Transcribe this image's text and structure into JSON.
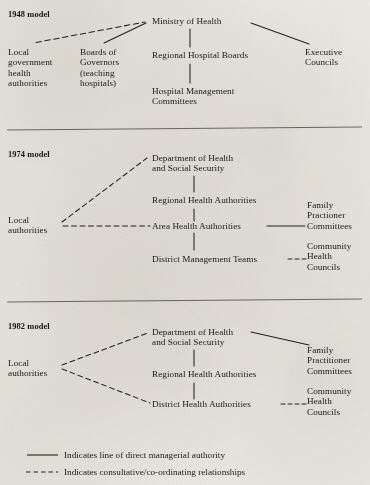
{
  "models": [
    {
      "id": "1948",
      "heading": "1948 model",
      "nodes": {
        "ministry": "Ministry of Health",
        "local_gov": "Local\ngovernment\nhealth\nauthorities",
        "boards_gov": "Boards of\nGovernors\n(teaching\nhospitals)",
        "regional_hospital_boards": "Regional Hospital Boards",
        "hospital_mgmt": "Hospital Management\nCommittees",
        "executive_councils": "Executive\nCouncils"
      }
    },
    {
      "id": "1974",
      "heading": "1974 model",
      "nodes": {
        "dhss": "Department of Health\nand Social Security",
        "local_authorities": "Local\nauthorities",
        "regional_health_authorities": "Regional Health Authorities",
        "area_health_authorities": "Area Health Authorities",
        "district_management_teams": "District Management Teams",
        "family_practioner_committees": "Family\nPractioner\nCommittees",
        "community_health_councils": "Community\nHealth\nCouncils"
      }
    },
    {
      "id": "1982",
      "heading": "1982 model",
      "nodes": {
        "dhss": "Department of Health\nand Social Security",
        "local_authorities": "Local\nauthorities",
        "regional_health_authorities": "Regional Health Authorities",
        "district_health_authorities": "District Health Authorities",
        "family_practitioner_committees": "Family\nPractitioner\nCommittees",
        "community_health_councils": "Community\nHealth\nCouncils"
      }
    }
  ],
  "legend": {
    "solid": "Indicates line of direct managerial authority",
    "dashed": "Indicates consultative/co-ordinating relationships"
  },
  "colors": {
    "ink": "#1b1a18",
    "paper": "#eceae4",
    "rule": "#6f6c66"
  }
}
